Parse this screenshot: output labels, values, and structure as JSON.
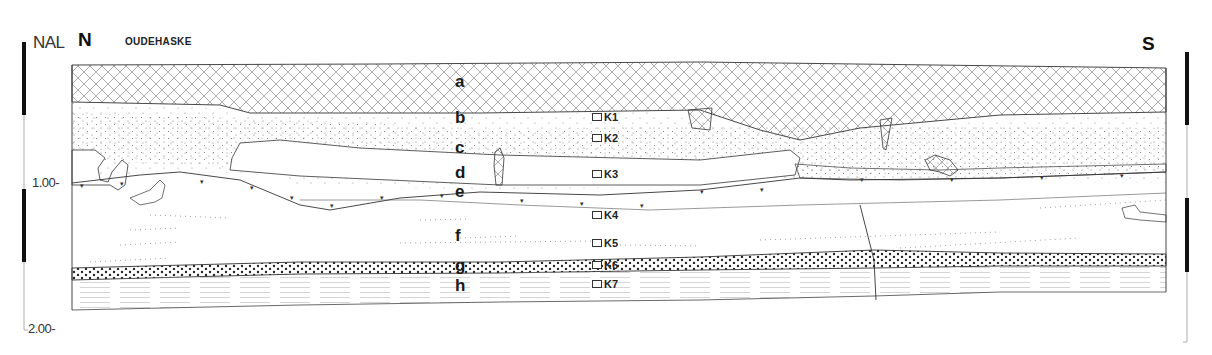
{
  "header": {
    "datum_label": "NAL",
    "north_label": "N",
    "south_label": "S",
    "site_name": "OUDEHASKE"
  },
  "scale": {
    "ticks": [
      {
        "label": "1.00-",
        "value": 1.0
      },
      {
        "label": "2.00-",
        "value": 2.0
      }
    ],
    "unit": "m below NAL",
    "segments": [
      "black",
      "white",
      "black",
      "white"
    ]
  },
  "layers": [
    {
      "id": "a",
      "label": "a",
      "pattern": "cross-hatch"
    },
    {
      "id": "b",
      "label": "b",
      "pattern": "sparse-dots"
    },
    {
      "id": "c",
      "label": "c",
      "pattern": "dense-stipple"
    },
    {
      "id": "d",
      "label": "d",
      "pattern": "stipple"
    },
    {
      "id": "e",
      "label": "e",
      "pattern": "v-marks"
    },
    {
      "id": "f",
      "label": "f",
      "pattern": "dotted-lines"
    },
    {
      "id": "g",
      "label": "g",
      "pattern": "bold-dots"
    },
    {
      "id": "h",
      "label": "h",
      "pattern": "horizontal-lines"
    }
  ],
  "samples": [
    {
      "label": "K1"
    },
    {
      "label": "K2"
    },
    {
      "label": "K3"
    },
    {
      "label": "K4"
    },
    {
      "label": "K5"
    },
    {
      "label": "K6"
    },
    {
      "label": "K7"
    }
  ],
  "colors": {
    "ink": "#1a1a1a",
    "paper": "#ffffff",
    "hatch": "#888888"
  }
}
